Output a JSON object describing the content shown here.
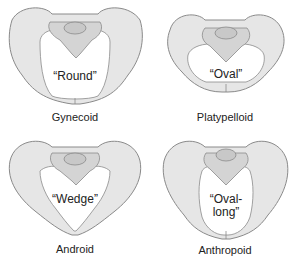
{
  "figure": {
    "panels": [
      {
        "id": "gynecoid",
        "shape_label": "“Round”",
        "caption": "Gynecoid"
      },
      {
        "id": "platypelloid",
        "shape_label": "“Oval”",
        "caption": "Platypelloid"
      },
      {
        "id": "android",
        "shape_label": "“Wedge”",
        "caption": "Android"
      },
      {
        "id": "anthropoid",
        "shape_label_line1": "“Oval-",
        "shape_label_line2": "long”",
        "caption": "Anthropoid"
      }
    ],
    "colors": {
      "bone_fill": "#e6e6e6",
      "bone_stroke": "#8a8a8a",
      "sacrum_fill": "#d4d4d4",
      "text": "#222222"
    }
  }
}
